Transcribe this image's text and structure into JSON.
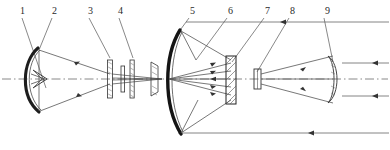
{
  "figure": {
    "width": 390,
    "height": 150,
    "background": "#ffffff",
    "ink_color": "#2b2b2b",
    "ray_color": "#555555",
    "axis_color": "#666666"
  },
  "labels": [
    {
      "id": "1",
      "text": "1",
      "x": 20,
      "y": 13,
      "leader": [
        [
          22,
          17
        ],
        [
          46,
          88
        ]
      ]
    },
    {
      "id": "2",
      "text": "2",
      "x": 52,
      "y": 13,
      "leader": [
        [
          52,
          17
        ],
        [
          39,
          50
        ]
      ]
    },
    {
      "id": "3",
      "text": "3",
      "x": 88,
      "y": 13,
      "leader": [
        [
          89,
          17
        ],
        [
          110,
          58
        ]
      ]
    },
    {
      "id": "4",
      "text": "4",
      "x": 118,
      "y": 13,
      "leader": [
        [
          119,
          17
        ],
        [
          133,
          58
        ]
      ]
    },
    {
      "id": "5",
      "text": "5",
      "x": 190,
      "y": 13,
      "leader": [
        [
          189,
          17
        ],
        [
          178,
          34
        ]
      ]
    },
    {
      "id": "6",
      "text": "6",
      "x": 228,
      "y": 13,
      "leader": [
        [
          227,
          17
        ],
        [
          196,
          60
        ]
      ]
    },
    {
      "id": "7",
      "text": "7",
      "x": 265,
      "y": 13,
      "leader": [
        [
          264,
          17
        ],
        [
          232,
          62
        ]
      ]
    },
    {
      "id": "8",
      "text": "8",
      "x": 290,
      "y": 13,
      "leader": [
        [
          289,
          17
        ],
        [
          257,
          72
        ]
      ]
    },
    {
      "id": "9",
      "text": "9",
      "x": 325,
      "y": 13,
      "leader": [
        [
          324,
          17
        ],
        [
          333,
          62
        ]
      ]
    }
  ],
  "optical_axis": {
    "name": "optical-axis",
    "y": 79,
    "x_start": 2,
    "x_end": 388,
    "style": "dash-dot"
  },
  "components": [
    {
      "id": "2",
      "name": "primary-concave-mirror",
      "type": "mirror",
      "x": 30,
      "y_top": 48,
      "y_bottom": 112
    },
    {
      "id": "1",
      "name": "secondary-element",
      "type": "small-mirror",
      "x": 42,
      "y": 79
    },
    {
      "id": "3",
      "name": "lens-element-3",
      "type": "lens",
      "x": 110,
      "y": 79
    },
    {
      "id": "4",
      "name": "lens-group-4",
      "type": "lens-group",
      "x": 133,
      "y": 79
    },
    {
      "id": "5",
      "name": "large-parabolic-mirror",
      "type": "mirror",
      "x": 174,
      "y_top": 30,
      "y_bottom": 134
    },
    {
      "id": "6",
      "name": "field-element-6",
      "type": "lens",
      "x": 162,
      "y": 79
    },
    {
      "id": "7",
      "name": "hatched-prism-block",
      "type": "prism",
      "x": 232,
      "y": 79
    },
    {
      "id": "8",
      "name": "detector-stop-8",
      "type": "aperture",
      "x": 257,
      "y": 79
    },
    {
      "id": "9",
      "name": "biconvex-output-lens",
      "type": "lens",
      "x": 333,
      "y": 79
    }
  ],
  "rays": {
    "top_outgoing_y": 22,
    "bottom_outgoing_y": 133,
    "description": "Collimated rays exit right; converging bundles between mirrors and lens groups"
  }
}
